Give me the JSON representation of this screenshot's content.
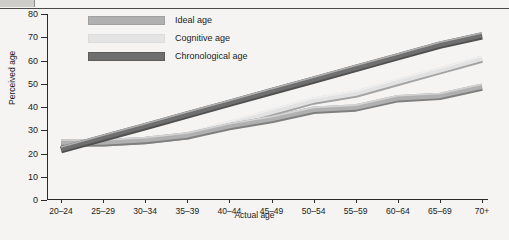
{
  "title": "",
  "axes": {
    "ylabel": "Perceived age",
    "xlabel": "Actual age",
    "yticks": [
      "0",
      "10",
      "20",
      "30",
      "40",
      "50",
      "60",
      "70",
      "80"
    ]
  },
  "legend": [
    {
      "label": "Ideal age",
      "color": "#b0b0b0"
    },
    {
      "label": "Cognitive age",
      "color": "#e2e2e2"
    },
    {
      "label": "Chronological age",
      "color": "#6f6f6f"
    }
  ],
  "chart_data": {
    "type": "line",
    "title": "",
    "xlabel": "Actual age",
    "ylabel": "Perceived age",
    "ylim": [
      0,
      80
    ],
    "ytick_step": 10,
    "grid": false,
    "legend_position": "top-left",
    "categories": [
      "20–24",
      "25–29",
      "30–34",
      "35–39",
      "40–44",
      "45–49",
      "50–54",
      "55–59",
      "60–64",
      "65–69",
      "70+"
    ],
    "series": [
      {
        "name": "Chronological age",
        "color": "#6f6f6f",
        "values": [
          22,
          27,
          32,
          37,
          42,
          47,
          52,
          57,
          62,
          67,
          71
        ]
      },
      {
        "name": "Cognitive age",
        "color": "#e2e2e2",
        "values": [
          25,
          25,
          26,
          28,
          33,
          38,
          43,
          46,
          51,
          56,
          61
        ]
      },
      {
        "name": "Ideal age",
        "color": "#b0b0b0",
        "values": [
          25,
          25,
          26,
          28,
          32,
          35,
          39,
          40,
          44,
          45,
          49
        ]
      }
    ]
  }
}
